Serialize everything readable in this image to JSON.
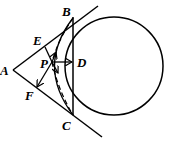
{
  "diagram": {
    "type": "geometry",
    "labels": {
      "A": "A",
      "B": "B",
      "C": "C",
      "D": "D",
      "E": "E",
      "F": "F",
      "P": "P"
    },
    "points": {
      "A": [
        13,
        70
      ],
      "B": [
        73,
        18
      ],
      "C": [
        73,
        115
      ],
      "D": [
        73,
        62
      ],
      "E": [
        45,
        47
      ],
      "F": [
        37,
        87
      ],
      "P": [
        52,
        62
      ]
    },
    "circle": {
      "cx": 114,
      "cy": 66,
      "r": 49
    },
    "stroke_color": "#000000"
  }
}
